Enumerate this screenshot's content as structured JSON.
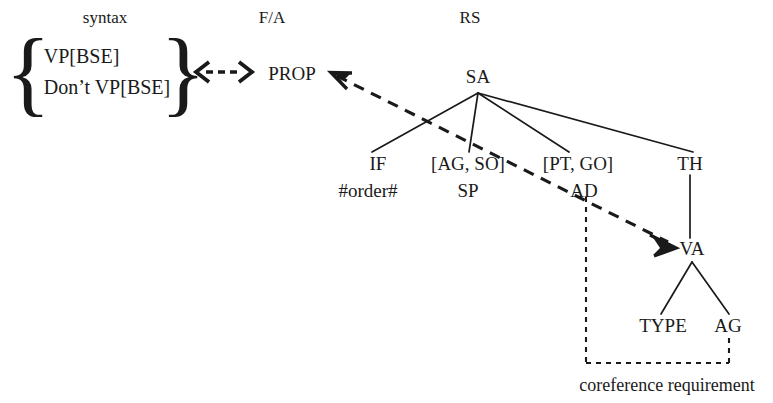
{
  "figure": {
    "background": "#ffffff",
    "ink": "#1a1a1a"
  },
  "columns": [
    {
      "id": "syntax",
      "label": "syntax",
      "x": 105,
      "y": 17
    },
    {
      "id": "fa",
      "label": "F/A",
      "x": 272,
      "y": 17
    },
    {
      "id": "rs",
      "label": "RS",
      "x": 470,
      "y": 17
    }
  ],
  "syntax_set": {
    "open_brace": "{",
    "close_brace": "}",
    "items": [
      "VP[BSE]",
      "Don’t VP[BSE]"
    ]
  },
  "fa": {
    "prop_label": "PROP"
  },
  "rs_tree": {
    "root": {
      "id": "sa",
      "label": "SA",
      "x": 478,
      "y": 76
    },
    "children": [
      {
        "id": "if",
        "label": "IF",
        "x": 378,
        "y": 163,
        "sub": "#order#",
        "sub_x": 368,
        "sub_y": 190
      },
      {
        "id": "agso",
        "label": "[AG, SO]",
        "x": 468,
        "y": 163,
        "sub": "SP",
        "sub_x": 468,
        "sub_y": 190
      },
      {
        "id": "ptgo",
        "label": "[PT, GO]",
        "x": 578,
        "y": 163,
        "sub": "AD",
        "sub_x": 584,
        "sub_y": 190
      },
      {
        "id": "th",
        "label": "TH",
        "x": 690,
        "y": 163,
        "sub": "",
        "sub_x": 0,
        "sub_y": 0
      }
    ],
    "va": {
      "id": "va",
      "label": "VA",
      "x": 692,
      "y": 248
    },
    "va_children": [
      {
        "id": "type",
        "label": "TYPE",
        "x": 663,
        "y": 325
      },
      {
        "id": "ag",
        "label": "AG",
        "x": 728,
        "y": 325
      }
    ]
  },
  "annotations": {
    "coreference": "coreference requirement",
    "coreference_x": 667,
    "coreference_y": 385
  },
  "arrows": {
    "syntax_to_prop": "double-headed dashed arrow",
    "va_to_prop": "dashed double arrow"
  }
}
